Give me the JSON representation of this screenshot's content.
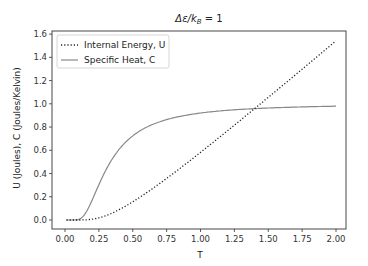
{
  "chart_data": {
    "type": "line",
    "xlabel": "T",
    "ylabel": "U (Joules), C (Joules/Kelvin)",
    "xlim": [
      -0.09,
      2.09
    ],
    "ylim": [
      -0.08,
      1.62
    ],
    "xticks": [
      "0.00",
      "0.25",
      "0.50",
      "0.75",
      "1.00",
      "1.25",
      "1.50",
      "1.75",
      "2.00"
    ],
    "yticks": [
      "0.0",
      "0.2",
      "0.4",
      "0.6",
      "0.8",
      "1.0",
      "1.2",
      "1.4",
      "1.6"
    ],
    "grid": false,
    "legend_position": "upper left",
    "x": [
      0.01,
      0.1,
      0.15,
      0.2,
      0.25,
      0.3,
      0.35,
      0.4,
      0.5,
      0.6,
      0.75,
      1.0,
      1.25,
      1.4,
      1.5,
      1.75,
      2.0
    ],
    "series": [
      {
        "name": "Internal Energy, U",
        "style": "dotted",
        "color": "#222222",
        "values": [
          0.0,
          0.0,
          0.001,
          0.007,
          0.019,
          0.037,
          0.059,
          0.085,
          0.157,
          0.233,
          0.359,
          0.582,
          0.82,
          0.967,
          1.061,
          1.306,
          1.541
        ]
      },
      {
        "name": "Specific Heat, C",
        "style": "solid",
        "color": "#888888",
        "values": [
          0.0,
          0.005,
          0.057,
          0.171,
          0.304,
          0.421,
          0.516,
          0.591,
          0.724,
          0.792,
          0.86,
          0.921,
          0.948,
          0.958,
          0.963,
          0.973,
          0.979
        ]
      }
    ]
  },
  "title": "Δε/k",
  "title_sub": "B",
  "title_rhs": " = 1",
  "xlabel": "T",
  "ylabel": "U (Joules), C (Joules/Kelvin)",
  "legend": [
    "Internal Energy, U",
    "Specific Heat, C"
  ]
}
